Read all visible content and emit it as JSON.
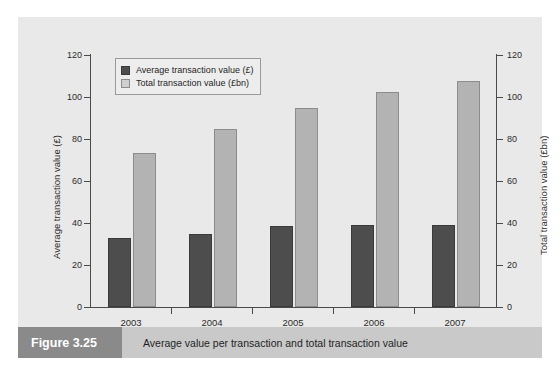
{
  "figure": {
    "tag": "Figure 3.25",
    "caption": "Average value per transaction and total transaction value"
  },
  "colors": {
    "page_background": "#ffffff",
    "panel_background": "#e9e9e9",
    "caption_bar": "#c9c9c9",
    "caption_tag": "#8a8a8a",
    "series_average": "#4d4d4d",
    "series_total": "#b3b3b3",
    "axis": "#4a4a4a"
  },
  "chart_data": {
    "type": "bar",
    "title": "",
    "categories": [
      "2003",
      "2004",
      "2005",
      "2006",
      "2007"
    ],
    "series": [
      {
        "name": "Average transaction value (£)",
        "axis": "left",
        "color": "#4d4d4d",
        "values": [
          33,
          35,
          38.5,
          39,
          39
        ]
      },
      {
        "name": "Total transaction value (£bn)",
        "axis": "right",
        "color": "#b3b3b3",
        "values": [
          73.5,
          85,
          95,
          102.5,
          107.5
        ]
      }
    ],
    "xlabel": "",
    "ylabel": "Average transaction value (£)",
    "ylabel_right": "Total transaction value (£bn)",
    "ylim": [
      0,
      120
    ],
    "ylim_right": [
      0,
      120
    ],
    "yticks": [
      0,
      20,
      40,
      60,
      80,
      100,
      120
    ],
    "yticks_right": [
      0,
      20,
      40,
      60,
      80,
      100,
      120
    ],
    "grid": false,
    "legend_position": "upper left"
  }
}
